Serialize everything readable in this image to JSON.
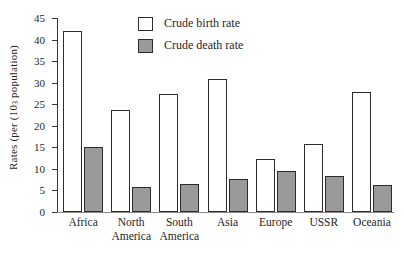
{
  "chart_data": {
    "type": "bar",
    "title": "",
    "subtitle": "",
    "xlabel": "",
    "ylabel": "Rates (per (10₃ population)",
    "ylabel_parts": {
      "before": "Rates (per (10",
      "sub": "3",
      "after": " population)"
    },
    "categories": [
      "Africa",
      "North\nAmerica",
      "South\nAmerica",
      "Asia",
      "Europe",
      "USSR",
      "Oceania"
    ],
    "category_labels": [
      {
        "line1": "Africa",
        "line2": ""
      },
      {
        "line1": "North",
        "line2": "America"
      },
      {
        "line1": "South",
        "line2": "America"
      },
      {
        "line1": "Asia",
        "line2": ""
      },
      {
        "line1": "Europe",
        "line2": ""
      },
      {
        "line1": "USSR",
        "line2": ""
      },
      {
        "line1": "Oceania",
        "line2": ""
      }
    ],
    "series": [
      {
        "name": "Crude birth rate",
        "color": "#ffffff",
        "values": [
          42.0,
          23.7,
          27.3,
          30.8,
          12.3,
          15.7,
          27.8
        ]
      },
      {
        "name": "Crude death rate",
        "color": "#9a9a9a",
        "values": [
          15.0,
          5.7,
          6.5,
          7.6,
          9.6,
          8.3,
          6.2
        ]
      }
    ],
    "ylim": [
      0,
      45
    ],
    "ytick_values": [
      0,
      5,
      10,
      15,
      20,
      25,
      30,
      35,
      40,
      45
    ],
    "ytick_labels": [
      "0",
      "5",
      "10",
      "15",
      "20",
      "25",
      "30",
      "35",
      "40",
      "45"
    ],
    "grid": false,
    "legend_position": "top-center"
  },
  "legend": {
    "entries": [
      {
        "label": "Crude birth rate",
        "swatch_color": "#ffffff"
      },
      {
        "label": "Crude death rate",
        "swatch_color": "#9a9a9a"
      }
    ]
  }
}
